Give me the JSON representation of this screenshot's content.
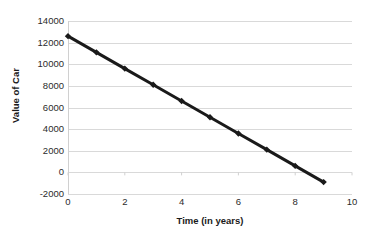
{
  "chart_data": {
    "type": "line",
    "title": "",
    "xlabel": "Time (in years)",
    "ylabel": "Value of Car",
    "xlim": [
      0,
      10
    ],
    "ylim": [
      -2000,
      14000
    ],
    "xticks": [
      0,
      2,
      4,
      6,
      8,
      10
    ],
    "ytick_labels": [
      "14000",
      "12000",
      "10000",
      "8000",
      "6000",
      "4000",
      "2000",
      "0",
      "-2000"
    ],
    "yticks": [
      14000,
      12000,
      10000,
      8000,
      6000,
      4000,
      2000,
      0,
      -2000
    ],
    "grid": true,
    "legend": false,
    "series": [
      {
        "name": "Value of Car",
        "marker": "diamond",
        "color": "#1a1a1a",
        "x": [
          0,
          1,
          2,
          3,
          4,
          5,
          6,
          7,
          8,
          9
        ],
        "values": [
          12600,
          11100,
          9600,
          8100,
          6600,
          5100,
          3600,
          2100,
          600,
          -900
        ]
      }
    ]
  }
}
